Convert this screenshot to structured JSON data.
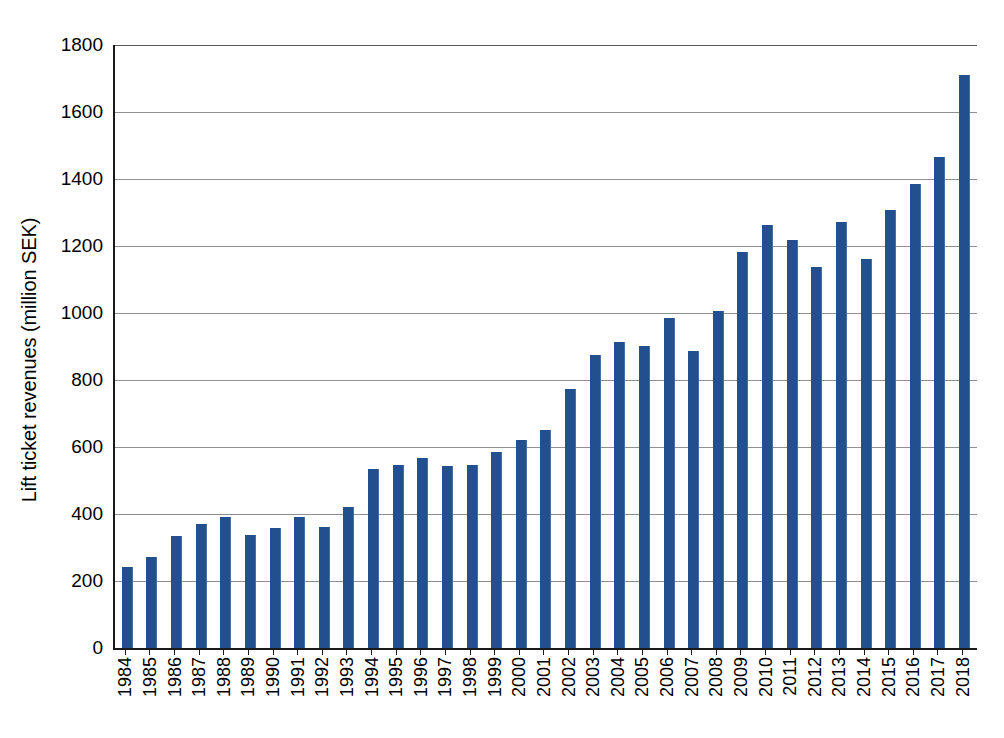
{
  "chart_data": {
    "type": "bar",
    "title": "",
    "subtitle": "",
    "xlabel": "",
    "ylabel": "Lift ticket revenues (million SEK)",
    "ylim": [
      0,
      1800
    ],
    "ytick_step": 200,
    "yticks": [
      1800,
      1600,
      1400,
      1200,
      1000,
      800,
      600,
      400,
      200,
      0
    ],
    "grid": "horizontal",
    "legend": "none",
    "bar_color": "#22508E",
    "categories": [
      "1984",
      "1985",
      "1986",
      "1987",
      "1988",
      "1989",
      "1990",
      "1991",
      "1992",
      "1993",
      "1994",
      "1995",
      "1996",
      "1997",
      "1998",
      "1999",
      "2000",
      "2001",
      "2002",
      "2003",
      "2004",
      "2005",
      "2006",
      "2007",
      "2008",
      "2009",
      "2010",
      "2011",
      "2012",
      "2013",
      "2014",
      "2015",
      "2016",
      "2017",
      "2018"
    ],
    "values": [
      242,
      272,
      334,
      370,
      390,
      337,
      358,
      392,
      362,
      420,
      535,
      545,
      566,
      544,
      545,
      585,
      620,
      652,
      772,
      874,
      912,
      902,
      985,
      888,
      1006,
      1182,
      1263,
      1217,
      1138,
      1272,
      1160,
      1307,
      1385,
      1465,
      1710
    ]
  },
  "axes": {
    "y_title": "Lift ticket revenues (million SEK)"
  },
  "caption": {
    "text": ""
  }
}
